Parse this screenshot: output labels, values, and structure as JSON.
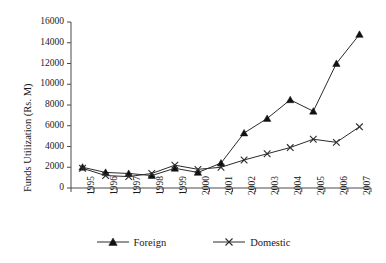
{
  "chart_data": {
    "type": "line",
    "title": "",
    "xlabel": "",
    "ylabel": "Funds Utilization (Rs. M)",
    "categories": [
      "1995",
      "1996",
      "1997",
      "1998",
      "1999",
      "2000",
      "2001",
      "2002",
      "2003",
      "2004",
      "2005",
      "2006",
      "2007"
    ],
    "series": [
      {
        "name": "Foreign",
        "marker": "filled-triangle",
        "values": [
          2000,
          1500,
          1400,
          1200,
          1900,
          1500,
          2400,
          5300,
          6700,
          8500,
          7400,
          12000,
          14800
        ]
      },
      {
        "name": "Domestic",
        "marker": "cross-x",
        "values": [
          1900,
          1200,
          1100,
          1400,
          2200,
          1800,
          2000,
          2700,
          3300,
          3900,
          4700,
          4400,
          5900
        ]
      }
    ],
    "ylim": [
      0,
      16000
    ],
    "yticks": [
      0,
      2000,
      4000,
      6000,
      8000,
      10000,
      12000,
      14000,
      16000
    ],
    "ytick_labels": [
      "0",
      "2000",
      "4000",
      "6000",
      "8000",
      "10000",
      "12000",
      "14000",
      "16000"
    ],
    "grid": false,
    "legend_position": "bottom",
    "axis_color": "#4a4a4a",
    "series_color": "#2b2b2b"
  },
  "legend": {
    "foreign_label": "Foreign",
    "domestic_label": "Domestic"
  }
}
